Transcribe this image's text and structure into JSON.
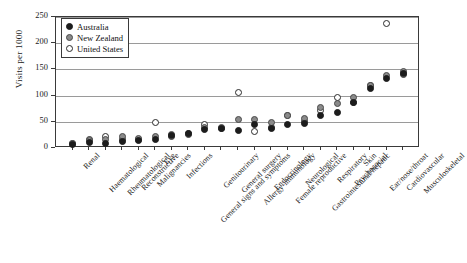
{
  "chart_data": {
    "type": "scatter",
    "title": "",
    "xlabel": "",
    "ylabel": "Visits per 1000",
    "ylim": [
      0,
      250
    ],
    "yticks": [
      0,
      50,
      100,
      150,
      200,
      250
    ],
    "grid": true,
    "legend_position": "top-left",
    "categories": [
      "Renal",
      "Haematological",
      "Rheumatological",
      "Reconstructive",
      "Malignancies",
      "Eye",
      "Infections",
      "General signs and symptoms",
      "Genitourinary",
      "General surgery",
      "Allergy-immunology",
      "Endocrinology",
      "Female reproductive",
      "Neurological",
      "Gastrointestinal/hepatic",
      "Respiratory",
      "Psychosocial",
      "Skin",
      "Ear/nose/throat",
      "Cardiovascular",
      "Musculoskeletal"
    ],
    "series": [
      {
        "name": "Australia",
        "marker": "filled-circle",
        "color": "#1c1c1c",
        "values": [
          6,
          11,
          9,
          12,
          14,
          17,
          24,
          27,
          36,
          37,
          34,
          44,
          37,
          44,
          47,
          62,
          68,
          87,
          113,
          133,
          143
        ]
      },
      {
        "name": "New Zealand",
        "marker": "gray-circle",
        "color": "#8a8a8a",
        "values": [
          9,
          14,
          17,
          22,
          19,
          22,
          26,
          27,
          39,
          40,
          54,
          55,
          49,
          62,
          56,
          77,
          84,
          96,
          120,
          138,
          146
        ]
      },
      {
        "name": "United States",
        "marker": "open-circle",
        "color": "#ffffff",
        "values": [
          8,
          16,
          21,
          17,
          17,
          48,
          22,
          25,
          45,
          38,
          105,
          31,
          40,
          62,
          51,
          72,
          96,
          86,
          119,
          238,
          140
        ]
      }
    ]
  },
  "legend": {
    "entries": [
      {
        "label": "Australia",
        "marker": "filled-circle"
      },
      {
        "label": "New Zealand",
        "marker": "gray-circle"
      },
      {
        "label": "United States",
        "marker": "open-circle"
      }
    ]
  },
  "axis": {
    "y_title": "Visits per 1000",
    "y_tick_labels": [
      "250",
      "200",
      "150",
      "100",
      "50",
      "0"
    ]
  },
  "colors": {
    "australia": "#1c1c1c",
    "new_zealand": "#8a8a8a",
    "united_states": "#ffffff",
    "grid": "#9a9a9a",
    "frame": "#3a3a3a",
    "text": "#1a1a1a"
  }
}
